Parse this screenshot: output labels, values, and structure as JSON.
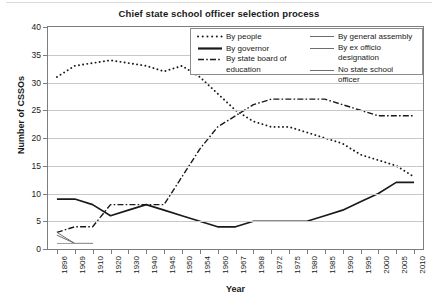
{
  "figure": {
    "title": "Chief state school officer selection process"
  },
  "axes": {
    "x": {
      "title": "Year",
      "ticks": [
        "1896",
        "1909",
        "1910",
        "1920",
        "1930",
        "1940",
        "1945",
        "1950",
        "1954",
        "1960",
        "1967",
        "1968",
        "1972",
        "1975",
        "1980",
        "1985",
        "1990",
        "1995",
        "2000",
        "2005",
        "2010"
      ]
    },
    "y": {
      "title": "Number of CSSOs",
      "ticks": [
        "0",
        "5",
        "10",
        "15",
        "20",
        "25",
        "30",
        "35",
        "40"
      ]
    }
  },
  "legend": {
    "columns": [
      [
        {
          "label": "By people",
          "style": "dotted",
          "icon": "dotted-line-swatch"
        },
        {
          "label": "By governor",
          "style": "solid-thick",
          "icon": "solid-thick-line-swatch"
        },
        {
          "label": "By state board of education",
          "style": "dash-dot",
          "icon": "dash-dot-line-swatch"
        }
      ],
      [
        {
          "label": "By general assembly",
          "style": "solid-thin",
          "icon": "solid-thin-line-swatch"
        },
        {
          "label": "By ex officio designation",
          "style": "solid-thin",
          "icon": "solid-thin-line-swatch"
        },
        {
          "label": "No state school officer",
          "style": "solid-thin",
          "icon": "solid-thin-line-swatch"
        }
      ]
    ]
  },
  "chart_data": {
    "type": "line",
    "title": "Chief state school officer selection process",
    "xlabel": "Year",
    "ylabel": "Number of CSSOs",
    "ylim": [
      0,
      40
    ],
    "ytick_step": 5,
    "grid": true,
    "legend_position": "top-right inside plot",
    "categories": [
      "1896",
      "1909",
      "1910",
      "1920",
      "1930",
      "1940",
      "1945",
      "1950",
      "1954",
      "1960",
      "1967",
      "1968",
      "1972",
      "1975",
      "1980",
      "1985",
      "1990",
      "1995",
      "2000",
      "2005",
      "2010"
    ],
    "series": [
      {
        "name": "By people",
        "style": "dotted",
        "color": "#1a1a1a",
        "values": [
          31,
          33,
          33.5,
          34,
          33.5,
          33,
          32,
          33,
          31,
          28,
          25,
          23,
          22,
          22,
          21,
          20,
          19,
          17,
          16,
          15,
          13
        ]
      },
      {
        "name": "By governor",
        "style": "solid-thick",
        "color": "#1a1a1a",
        "values": [
          9,
          9,
          8,
          6,
          7,
          8,
          7,
          6,
          5,
          4,
          4,
          5,
          5,
          5,
          5,
          6,
          7,
          8.5,
          10,
          12,
          12
        ]
      },
      {
        "name": "By state board of education",
        "style": "dash-dot",
        "color": "#1a1a1a",
        "values": [
          3,
          4,
          4,
          8,
          8,
          8,
          8,
          13,
          18,
          22,
          24,
          26,
          27,
          27,
          27,
          27,
          26,
          25,
          24,
          24,
          24
        ]
      },
      {
        "name": "By general assembly",
        "style": "solid-thin",
        "color": "#6e6e6e",
        "values": [
          3,
          1,
          1,
          null,
          null,
          null,
          null,
          null,
          null,
          null,
          null,
          null,
          null,
          null,
          null,
          null,
          null,
          null,
          null,
          null,
          null
        ]
      },
      {
        "name": "By ex officio designation",
        "style": "solid-thin",
        "color": "#6e6e6e",
        "values": [
          2.5,
          1,
          1,
          null,
          null,
          null,
          null,
          null,
          null,
          null,
          null,
          null,
          null,
          null,
          null,
          null,
          null,
          null,
          null,
          null,
          null
        ]
      },
      {
        "name": "No state school officer",
        "style": "solid-thin",
        "color": "#9a9a9a",
        "values": [
          1,
          1,
          1,
          null,
          null,
          null,
          null,
          null,
          null,
          null,
          null,
          null,
          null,
          null,
          null,
          null,
          null,
          null,
          null,
          null,
          null
        ]
      }
    ]
  }
}
